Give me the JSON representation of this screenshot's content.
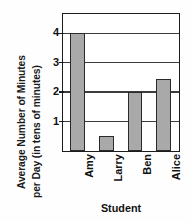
{
  "chart_data": {
    "type": "bar",
    "title": "",
    "subtitle": "",
    "xlabel": "Student",
    "ylabel": "Average Number of Minutes per Day (in tens of minutes)",
    "ylabel_lines": [
      "Average Number of Minutes",
      "per Day (in tens of minutes)"
    ],
    "categories": [
      "Amy",
      "Larry",
      "Ben",
      "Alice"
    ],
    "values": [
      4,
      0.5,
      2,
      2.45
    ],
    "ylim": [
      0,
      4.63
    ],
    "yticks": [
      1,
      2,
      3,
      4
    ],
    "ytick_labels": [
      "1",
      "2",
      "3",
      "4"
    ],
    "grid": true,
    "grid_axis": "y",
    "legend": false,
    "bar_color": "#a9a9a9",
    "bar_edge_color": "#2a2a2a",
    "axis_color": "#1c1c1c",
    "xtick_rotation": 90
  }
}
